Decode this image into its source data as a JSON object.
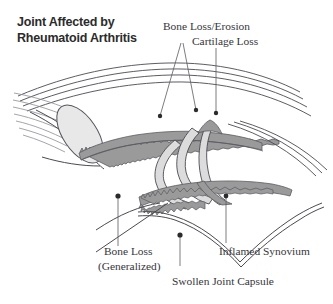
{
  "figure": {
    "type": "medical-illustration",
    "background_color": "#ffffff",
    "line_color": "#4a4a52",
    "synovium_fill": "#9a9a9a",
    "cartilage_fill": "#dcdcdc",
    "marrow_fill": "#e8e8e8"
  },
  "title": {
    "line1": "Joint Affected by",
    "line2": "Rheumatoid Arthritis",
    "color": "#2b2b2b"
  },
  "callouts": [
    {
      "id": "bone-loss-erosion",
      "label": "Bone Loss/Erosion"
    },
    {
      "id": "cartilage-loss",
      "label": "Cartilage Loss"
    },
    {
      "id": "bone-loss-generalized-1",
      "label": "Bone Loss"
    },
    {
      "id": "bone-loss-generalized-2",
      "label": "(Generalized)"
    },
    {
      "id": "inflamed-synovium",
      "label": "Inflamed Synovium"
    },
    {
      "id": "swollen-joint-capsule",
      "label": "Swollen Joint Capsule"
    }
  ]
}
